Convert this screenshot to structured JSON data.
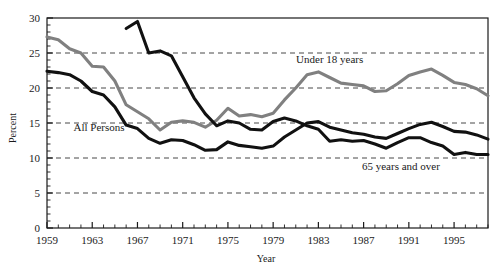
{
  "chart_data": {
    "type": "line",
    "title": "",
    "xlabel": "Year",
    "ylabel": "Percent",
    "xlim": [
      1959,
      1998
    ],
    "ylim": [
      0,
      30
    ],
    "grid": true,
    "gridlines_y": [
      5,
      10,
      15,
      20,
      25
    ],
    "legend_position": "inline-annotations",
    "ytick_labels": [
      "0",
      "5",
      "10",
      "15",
      "20",
      "25",
      "30"
    ],
    "ytick_values": [
      0,
      5,
      10,
      15,
      20,
      25,
      30
    ],
    "xtick_labels": [
      "1959",
      "1963",
      "1967",
      "1971",
      "1975",
      "1979",
      "1983",
      "1987",
      "1991",
      "1995"
    ],
    "xtick_values": [
      1959,
      1963,
      1967,
      1971,
      1975,
      1979,
      1983,
      1987,
      1991,
      1995
    ],
    "x": [
      1959,
      1960,
      1961,
      1962,
      1963,
      1964,
      1965,
      1966,
      1967,
      1968,
      1969,
      1970,
      1971,
      1972,
      1973,
      1974,
      1975,
      1976,
      1977,
      1978,
      1979,
      1980,
      1981,
      1982,
      1983,
      1984,
      1985,
      1986,
      1987,
      1988,
      1989,
      1990,
      1991,
      1992,
      1993,
      1994,
      1995,
      1996,
      1997,
      1998
    ],
    "series": [
      {
        "name": "Under 18 years",
        "color": "#808080",
        "x": [
          1959,
          1960,
          1961,
          1962,
          1963,
          1964,
          1965,
          1966,
          1967,
          1968,
          1969,
          1970,
          1971,
          1972,
          1973,
          1974,
          1975,
          1976,
          1977,
          1978,
          1979,
          1980,
          1981,
          1982,
          1983,
          1984,
          1985,
          1986,
          1987,
          1988,
          1989,
          1990,
          1991,
          1992,
          1993,
          1994,
          1995,
          1996,
          1997,
          1998
        ],
        "values": [
          27.3,
          26.9,
          25.6,
          25.0,
          23.1,
          23.0,
          21.0,
          17.6,
          16.6,
          15.6,
          14.0,
          15.1,
          15.3,
          15.1,
          14.4,
          15.4,
          17.1,
          16.0,
          16.2,
          15.9,
          16.4,
          18.3,
          20.0,
          21.9,
          22.3,
          21.5,
          20.7,
          20.5,
          20.3,
          19.5,
          19.6,
          20.6,
          21.8,
          22.3,
          22.7,
          21.8,
          20.8,
          20.5,
          19.9,
          18.9
        ]
      },
      {
        "name": "All Persons",
        "color": "#111111",
        "x": [
          1959,
          1960,
          1961,
          1962,
          1963,
          1964,
          1965,
          1966,
          1967,
          1968,
          1969,
          1970,
          1971,
          1972,
          1973,
          1974,
          1975,
          1976,
          1977,
          1978,
          1979,
          1980,
          1981,
          1982,
          1983,
          1984,
          1985,
          1986,
          1987,
          1988,
          1989,
          1990,
          1991,
          1992,
          1993,
          1994,
          1995,
          1996,
          1997,
          1998
        ],
        "values": [
          22.4,
          22.2,
          21.9,
          21.0,
          19.5,
          19.0,
          17.3,
          14.7,
          14.2,
          12.8,
          12.1,
          12.6,
          12.5,
          11.9,
          11.1,
          11.2,
          12.3,
          11.8,
          11.6,
          11.4,
          11.7,
          13.0,
          14.0,
          15.0,
          15.2,
          14.4,
          14.0,
          13.6,
          13.4,
          13.0,
          12.8,
          13.5,
          14.2,
          14.8,
          15.1,
          14.5,
          13.8,
          13.7,
          13.3,
          12.7
        ]
      },
      {
        "name": "65 years and over",
        "color": "#111111",
        "x": [
          1966,
          1967,
          1968,
          1969,
          1970,
          1971,
          1972,
          1973,
          1974,
          1975,
          1976,
          1977,
          1978,
          1979,
          1980,
          1981,
          1982,
          1983,
          1984,
          1985,
          1986,
          1987,
          1988,
          1989,
          1990,
          1991,
          1992,
          1993,
          1994,
          1995,
          1996,
          1997,
          1998
        ],
        "values": [
          28.5,
          29.5,
          25.0,
          25.3,
          24.6,
          21.6,
          18.6,
          16.3,
          14.6,
          15.3,
          15.0,
          14.1,
          14.0,
          15.2,
          15.7,
          15.3,
          14.6,
          14.1,
          12.4,
          12.6,
          12.4,
          12.5,
          12.0,
          11.4,
          12.2,
          12.9,
          12.9,
          12.2,
          11.7,
          10.5,
          10.8,
          10.5,
          10.5
        ]
      }
    ],
    "annotations": [
      {
        "text": "Under 18 years",
        "x": 1984,
        "y": 23.6
      },
      {
        "text": "All Persons",
        "x": 1963.6,
        "y": 13.8
      },
      {
        "text": "65 years and over",
        "x": 1990.3,
        "y": 8.3
      }
    ]
  },
  "axis": {
    "x_title": "Year",
    "y_title": "Percent"
  },
  "labels": {
    "under18": "Under 18 years",
    "all_persons": "All Persons",
    "over65": "65 years and over"
  },
  "colors": {
    "series_gray": "#808080",
    "series_black": "#111111",
    "axis": "#1a1a1a",
    "grid": "#333333",
    "background": "#ffffff"
  }
}
